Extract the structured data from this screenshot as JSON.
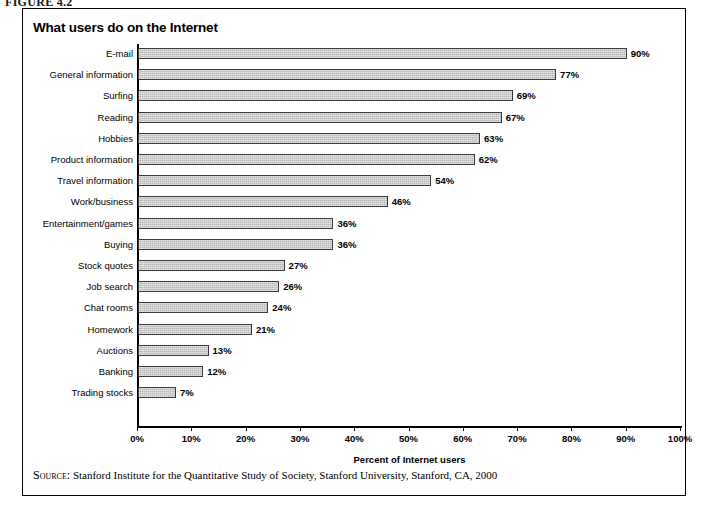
{
  "figure": {
    "caption": "FIGURE 4.2"
  },
  "chart_data": {
    "type": "bar",
    "orientation": "horizontal",
    "title": "What users do on the Internet",
    "xlabel": "Percent of Internet users",
    "ylabel": "",
    "xlim": [
      0,
      100
    ],
    "grid": false,
    "legend": "none",
    "xticks": [
      "0%",
      "10%",
      "20%",
      "30%",
      "40%",
      "50%",
      "60%",
      "70%",
      "80%",
      "90%",
      "100%"
    ],
    "xtick_values": [
      0,
      10,
      20,
      30,
      40,
      50,
      60,
      70,
      80,
      90,
      100
    ],
    "categories": [
      "E-mail",
      "General information",
      "Surfing",
      "Reading",
      "Hobbies",
      "Product information",
      "Travel information",
      "Work/business",
      "Entertainment/games",
      "Buying",
      "Stock quotes",
      "Job search",
      "Chat rooms",
      "Homework",
      "Auctions",
      "Banking",
      "Trading stocks"
    ],
    "values": [
      90,
      77,
      69,
      67,
      63,
      62,
      54,
      46,
      36,
      36,
      27,
      26,
      24,
      21,
      13,
      12,
      7
    ],
    "data_labels": [
      "90%",
      "77%",
      "69%",
      "67%",
      "63%",
      "62%",
      "54%",
      "46%",
      "36%",
      "36%",
      "27%",
      "26%",
      "24%",
      "21%",
      "13%",
      "12%",
      "7%"
    ],
    "bar_color": "#b9b9b9",
    "bar_border_color": "#3b3b3b",
    "axis_color": "#000000"
  },
  "source": {
    "label": "Source:",
    "text": " Stanford Institute for the Quantitative Study of Society, Stanford University, Stanford, CA, 2000"
  }
}
